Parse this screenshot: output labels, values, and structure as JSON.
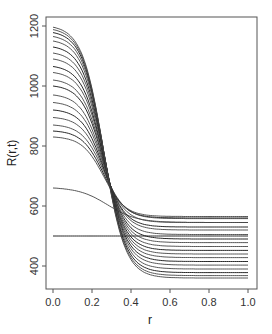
{
  "chart_data": {
    "type": "line",
    "title": "",
    "xlabel": "r",
    "ylabel": "R(r,t)",
    "xlim": [
      0.0,
      1.0
    ],
    "ylim": [
      320,
      1210
    ],
    "x_ticks": [
      "0.0",
      "0.2",
      "0.4",
      "0.6",
      "0.8",
      "1.0"
    ],
    "y_ticks": [
      "400",
      "600",
      "800",
      "1000",
      "1200"
    ],
    "grid": false,
    "legend": null,
    "x": [
      0.0,
      0.05,
      0.1,
      0.15,
      0.2,
      0.25,
      0.3,
      0.35,
      0.4,
      0.45,
      0.5,
      0.55,
      0.6,
      0.7,
      0.8,
      0.9,
      1.0
    ],
    "series": [
      {
        "name": "t0",
        "start": 500,
        "end": 500
      },
      {
        "name": "t1",
        "start": 660,
        "end": 545
      },
      {
        "name": "t2",
        "start": 830,
        "end": 565
      },
      {
        "name": "t3",
        "start": 850,
        "end": 560
      },
      {
        "name": "t4",
        "start": 870,
        "end": 558
      },
      {
        "name": "t5",
        "start": 895,
        "end": 545
      },
      {
        "name": "t6",
        "start": 920,
        "end": 530
      },
      {
        "name": "t7",
        "start": 945,
        "end": 520
      },
      {
        "name": "t8",
        "start": 970,
        "end": 505
      },
      {
        "name": "t9",
        "start": 1000,
        "end": 490
      },
      {
        "name": "t10",
        "start": 1020,
        "end": 478
      },
      {
        "name": "t11",
        "start": 1045,
        "end": 465
      },
      {
        "name": "t12",
        "start": 1065,
        "end": 452
      },
      {
        "name": "t13",
        "start": 1090,
        "end": 440
      },
      {
        "name": "t14",
        "start": 1110,
        "end": 428
      },
      {
        "name": "t15",
        "start": 1130,
        "end": 415
      },
      {
        "name": "t16",
        "start": 1150,
        "end": 403
      },
      {
        "name": "t17",
        "start": 1165,
        "end": 390
      },
      {
        "name": "t18",
        "start": 1178,
        "end": 378
      },
      {
        "name": "t19",
        "start": 1188,
        "end": 368
      },
      {
        "name": "t20",
        "start": 1196,
        "end": 360
      }
    ]
  },
  "axes": {
    "xlabel": "r",
    "ylabel": "R(r,t)"
  }
}
